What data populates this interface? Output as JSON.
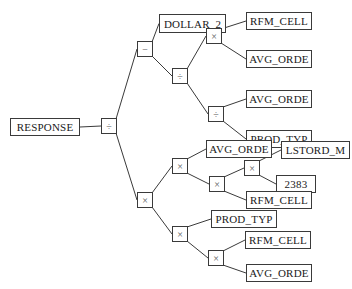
{
  "diagram": {
    "type": "expression-tree",
    "edge_color": "#3a3a3a",
    "nodes": [
      {
        "id": "n0",
        "kind": "term",
        "label": "RESPONSE",
        "x": 10,
        "y": 118,
        "w": 70,
        "h": 18
      },
      {
        "id": "n1",
        "kind": "op",
        "label": "÷",
        "x": 101,
        "y": 118,
        "w": 16,
        "h": 16
      },
      {
        "id": "n2",
        "kind": "op",
        "label": "−",
        "x": 137,
        "y": 41,
        "w": 16,
        "h": 16
      },
      {
        "id": "n3",
        "kind": "term",
        "label": "DOLLAR_2",
        "x": 159,
        "y": 14,
        "w": 67,
        "h": 19
      },
      {
        "id": "n4",
        "kind": "op",
        "label": "÷",
        "x": 172,
        "y": 68,
        "w": 16,
        "h": 16
      },
      {
        "id": "n5",
        "kind": "op",
        "label": "×",
        "x": 206,
        "y": 28,
        "w": 16,
        "h": 16
      },
      {
        "id": "n6",
        "kind": "term",
        "label": "RFM_CELL",
        "x": 246,
        "y": 12,
        "w": 66,
        "h": 18
      },
      {
        "id": "n7",
        "kind": "term",
        "label": "AVG_ORDE",
        "x": 246,
        "y": 50,
        "w": 66,
        "h": 18
      },
      {
        "id": "n8",
        "kind": "op",
        "label": "÷",
        "x": 208,
        "y": 106,
        "w": 16,
        "h": 16
      },
      {
        "id": "n9",
        "kind": "term",
        "label": "AVG_ORDE",
        "x": 246,
        "y": 90,
        "w": 66,
        "h": 18
      },
      {
        "id": "n10",
        "kind": "term",
        "label": "PROD_TYP",
        "x": 246,
        "y": 130,
        "w": 66,
        "h": 18
      },
      {
        "id": "n11",
        "kind": "op",
        "label": "×",
        "x": 137,
        "y": 192,
        "w": 16,
        "h": 16
      },
      {
        "id": "n12",
        "kind": "op",
        "label": "×",
        "x": 172,
        "y": 158,
        "w": 16,
        "h": 16
      },
      {
        "id": "n13",
        "kind": "term",
        "label": "AVG_ORDE",
        "x": 206,
        "y": 140,
        "w": 66,
        "h": 18
      },
      {
        "id": "n14",
        "kind": "op",
        "label": "×",
        "x": 209,
        "y": 176,
        "w": 16,
        "h": 16
      },
      {
        "id": "n15",
        "kind": "op",
        "label": "×",
        "x": 244,
        "y": 160,
        "w": 16,
        "h": 16
      },
      {
        "id": "n16",
        "kind": "term",
        "label": "LSTORD_M",
        "x": 281,
        "y": 141,
        "w": 69,
        "h": 18
      },
      {
        "id": "n17",
        "kind": "term",
        "label": "2383",
        "x": 276,
        "y": 175,
        "w": 40,
        "h": 18
      },
      {
        "id": "n18",
        "kind": "term",
        "label": "RFM_CELL",
        "x": 246,
        "y": 191,
        "w": 66,
        "h": 18
      },
      {
        "id": "n19",
        "kind": "op",
        "label": "×",
        "x": 172,
        "y": 226,
        "w": 16,
        "h": 16
      },
      {
        "id": "n20",
        "kind": "term",
        "label": "PROD_TYP",
        "x": 211,
        "y": 210,
        "w": 66,
        "h": 18
      },
      {
        "id": "n21",
        "kind": "op",
        "label": "×",
        "x": 208,
        "y": 250,
        "w": 16,
        "h": 16
      },
      {
        "id": "n22",
        "kind": "term",
        "label": "RFM_CELL",
        "x": 245,
        "y": 231,
        "w": 66,
        "h": 18
      },
      {
        "id": "n23",
        "kind": "term",
        "label": "AVG_ORDE",
        "x": 246,
        "y": 264,
        "w": 66,
        "h": 18
      }
    ],
    "edges": [
      [
        "n0",
        "n1"
      ],
      [
        "n1",
        "n2"
      ],
      [
        "n1",
        "n11"
      ],
      [
        "n2",
        "n3"
      ],
      [
        "n2",
        "n4"
      ],
      [
        "n4",
        "n5"
      ],
      [
        "n4",
        "n8"
      ],
      [
        "n5",
        "n6"
      ],
      [
        "n5",
        "n7"
      ],
      [
        "n8",
        "n9"
      ],
      [
        "n8",
        "n10"
      ],
      [
        "n11",
        "n12"
      ],
      [
        "n11",
        "n19"
      ],
      [
        "n12",
        "n13"
      ],
      [
        "n12",
        "n14"
      ],
      [
        "n14",
        "n15"
      ],
      [
        "n14",
        "n18"
      ],
      [
        "n15",
        "n16"
      ],
      [
        "n15",
        "n17"
      ],
      [
        "n19",
        "n20"
      ],
      [
        "n19",
        "n21"
      ],
      [
        "n21",
        "n22"
      ],
      [
        "n21",
        "n23"
      ]
    ]
  }
}
